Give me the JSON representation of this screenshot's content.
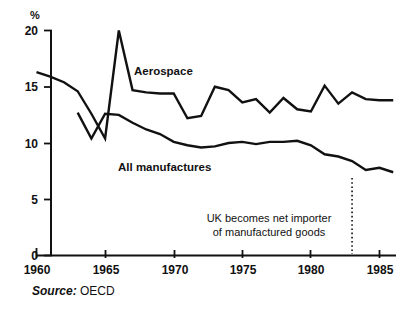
{
  "chart_data": {
    "type": "line",
    "title": "",
    "subtitle": "",
    "xlabel": "",
    "ylabel": "%",
    "ylim": [
      0,
      20
    ],
    "xlim": [
      1960,
      1986.5
    ],
    "grid": false,
    "legend_position": "inline-labels",
    "y_ticks": [
      0,
      5,
      10,
      15,
      20
    ],
    "y_tick_labels": [
      "0",
      "5",
      "10",
      "15",
      "20"
    ],
    "x_ticks": [
      1960,
      1965,
      1970,
      1975,
      1980,
      1985
    ],
    "x_tick_labels": [
      "1960",
      "1965",
      "1970",
      "1975",
      "1980",
      "1985"
    ],
    "series": [
      {
        "name": "Aerospace",
        "x": [
          1960,
          1961,
          1962,
          1963,
          1964,
          1965,
          1966,
          1967,
          1968,
          1969,
          1970,
          1971,
          1972,
          1973,
          1974,
          1975,
          1976,
          1977,
          1978,
          1979,
          1980,
          1981,
          1982,
          1983,
          1984,
          1985,
          1986
        ],
        "values": [
          16.3,
          15.9,
          15.4,
          14.6,
          12.6,
          10.4,
          20.0,
          14.7,
          14.5,
          14.4,
          14.4,
          12.2,
          12.4,
          15.0,
          14.7,
          13.6,
          13.9,
          12.7,
          14.0,
          13.0,
          12.8,
          15.1,
          13.5,
          14.5,
          13.9,
          13.8,
          13.8
        ]
      },
      {
        "name": "All manufactures",
        "x": [
          1963,
          1964,
          1965,
          1966,
          1967,
          1968,
          1969,
          1970,
          1971,
          1972,
          1973,
          1974,
          1975,
          1976,
          1977,
          1978,
          1979,
          1980,
          1981,
          1982,
          1983,
          1984,
          1985,
          1986
        ],
        "values": [
          12.7,
          10.4,
          12.6,
          12.5,
          11.8,
          11.2,
          10.8,
          10.1,
          9.8,
          9.6,
          9.7,
          10.0,
          10.1,
          9.9,
          10.1,
          10.1,
          10.2,
          9.8,
          9.0,
          8.8,
          8.4,
          7.6,
          7.8,
          7.4
        ]
      }
    ],
    "annotations": [
      {
        "name": "uk-net-importer",
        "line1": "UK becomes net importer",
        "line2": "of manufactured goods",
        "marker_type": "dotted-vertical-line",
        "marker_x": 1983
      }
    ],
    "source": {
      "prefix": "Source:",
      "value": "OECD"
    },
    "colors": {
      "line": "#111111",
      "axis": "#111111",
      "background": "#ffffff",
      "text": "#111111"
    }
  }
}
